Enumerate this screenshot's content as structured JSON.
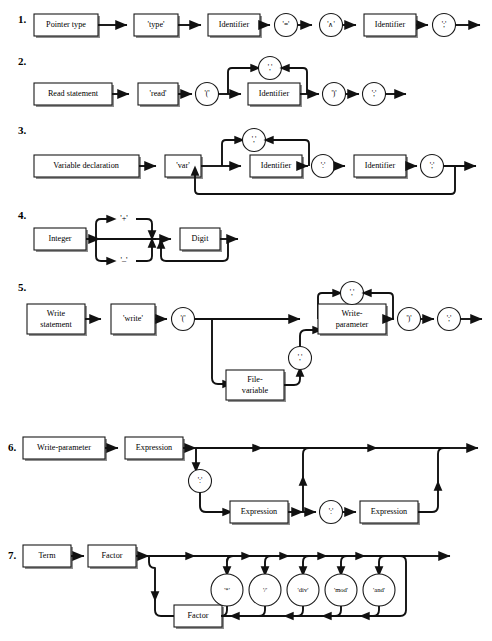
{
  "document": {
    "title": "Syntax Railroad Diagrams",
    "type": "railroad-diagram-sheet",
    "background": "#ffffff",
    "ink": "#111111",
    "shadow_color": "#8f8f8f",
    "width": 492,
    "height": 641
  },
  "diagrams": [
    {
      "number": "1.",
      "name": "pointer-type",
      "nodes": [
        {
          "kind": "box",
          "label": "Pointer type"
        },
        {
          "kind": "circle",
          "label": "'type'"
        },
        {
          "kind": "box",
          "label": "Identifier"
        },
        {
          "kind": "circle",
          "label": "'='"
        },
        {
          "kind": "circle",
          "label": "'∧'"
        },
        {
          "kind": "box",
          "label": "Identifier"
        },
        {
          "kind": "circle",
          "label": "';'"
        }
      ],
      "terminals": [
        "'type'",
        "'='",
        "'∧'",
        "';'"
      ],
      "nonterminals": [
        "Pointer type",
        "Identifier"
      ]
    },
    {
      "number": "2.",
      "name": "read-statement",
      "nodes": [
        {
          "kind": "box",
          "label": "Read statement"
        },
        {
          "kind": "box",
          "label": "'read'"
        },
        {
          "kind": "circle",
          "label": "'('"
        },
        {
          "kind": "box",
          "label": "Identifier"
        },
        {
          "kind": "circle",
          "label": "','"
        },
        {
          "kind": "circle",
          "label": "')'"
        },
        {
          "kind": "circle",
          "label": "';'"
        }
      ],
      "loops": [
        {
          "from": "Identifier",
          "through": "','",
          "to": "Identifier"
        }
      ],
      "terminals": [
        "'read'",
        "'('",
        "','",
        "')'",
        "';'"
      ],
      "nonterminals": [
        "Read statement",
        "Identifier"
      ]
    },
    {
      "number": "3.",
      "name": "variable-declaration",
      "nodes": [
        {
          "kind": "box",
          "label": "Variable declaration"
        },
        {
          "kind": "box",
          "label": "'var'"
        },
        {
          "kind": "box",
          "label": "Identifier"
        },
        {
          "kind": "circle",
          "label": "','"
        },
        {
          "kind": "circle",
          "label": "':'"
        },
        {
          "kind": "box",
          "label": "Identifier"
        },
        {
          "kind": "circle",
          "label": "';'"
        }
      ],
      "loops": [
        {
          "from": "Identifier",
          "through": "','",
          "to": "Identifier"
        },
        {
          "from": "';'",
          "through": "",
          "to": "Identifier"
        }
      ],
      "terminals": [
        "'var'",
        "','",
        "':'",
        "';'"
      ],
      "nonterminals": [
        "Variable declaration",
        "Identifier"
      ]
    },
    {
      "number": "4.",
      "name": "integer",
      "nodes": [
        {
          "kind": "box",
          "label": "Integer"
        },
        {
          "kind": "plain",
          "label": "'+'"
        },
        {
          "kind": "plain",
          "label": "'–'"
        },
        {
          "kind": "box",
          "label": "Digit"
        }
      ],
      "loops": [
        {
          "from": "Digit",
          "through": "",
          "to": "Digit"
        }
      ],
      "terminals": [
        "'+'",
        "'–'"
      ],
      "nonterminals": [
        "Integer",
        "Digit"
      ]
    },
    {
      "number": "5.",
      "name": "write-statement",
      "nodes": [
        {
          "kind": "box",
          "label": "Write statement"
        },
        {
          "kind": "box",
          "label": "'write'"
        },
        {
          "kind": "circle",
          "label": "'('"
        },
        {
          "kind": "box",
          "label": "File-variable"
        },
        {
          "kind": "circle",
          "label": "','"
        },
        {
          "kind": "box",
          "label": "Write-parameter"
        },
        {
          "kind": "circle",
          "label": "','"
        },
        {
          "kind": "circle",
          "label": "')'"
        },
        {
          "kind": "circle",
          "label": "';'"
        }
      ],
      "loops": [
        {
          "from": "Write-parameter",
          "through": "','",
          "to": "Write-parameter"
        }
      ],
      "terminals": [
        "'write'",
        "'('",
        "','",
        "')'",
        "';'"
      ],
      "nonterminals": [
        "Write statement",
        "File-variable",
        "Write-parameter"
      ]
    },
    {
      "number": "6.",
      "name": "write-parameter",
      "nodes": [
        {
          "kind": "box",
          "label": "Write-parameter"
        },
        {
          "kind": "box",
          "label": "Expression"
        },
        {
          "kind": "circle",
          "label": "':'"
        },
        {
          "kind": "box",
          "label": "Expression"
        },
        {
          "kind": "circle",
          "label": "':'"
        },
        {
          "kind": "box",
          "label": "Expression"
        }
      ],
      "terminals": [
        "':'"
      ],
      "nonterminals": [
        "Write-parameter",
        "Expression"
      ]
    },
    {
      "number": "7.",
      "name": "term",
      "nodes": [
        {
          "kind": "box",
          "label": "Term"
        },
        {
          "kind": "box",
          "label": "Factor"
        },
        {
          "kind": "circle",
          "label": "'*'"
        },
        {
          "kind": "circle",
          "label": "'/'"
        },
        {
          "kind": "circle",
          "label": "'div'"
        },
        {
          "kind": "circle",
          "label": "'mod'"
        },
        {
          "kind": "circle",
          "label": "'and'"
        },
        {
          "kind": "box",
          "label": "Factor"
        }
      ],
      "loops": [
        {
          "from": "Factor",
          "through": "'*' | '/' | 'div' | 'mod' | 'and'",
          "to": "Factor"
        }
      ],
      "terminals": [
        "'*'",
        "'/'",
        "'div'",
        "'mod'",
        "'and'"
      ],
      "nonterminals": [
        "Term",
        "Factor"
      ]
    }
  ],
  "labels": {
    "d1_n": "1.",
    "d2_n": "2.",
    "d3_n": "3.",
    "d4_n": "4.",
    "d5_n": "5.",
    "d6_n": "6.",
    "d7_n": "7.",
    "d1_b1": "Pointer type",
    "d1_c1": "'type'",
    "d1_b2": "Identifier",
    "d1_c2": "'='",
    "d1_c3": "'∧'",
    "d1_b3": "Identifier",
    "d1_c4": "';'",
    "d2_b1": "Read statement",
    "d2_b2": "'read'",
    "d2_c1": "'('",
    "d2_b3": "Identifier",
    "d2_c2": "','",
    "d2_c3": "')'",
    "d2_c4": "';'",
    "d3_b1": "Variable declaration",
    "d3_b2": "'var'",
    "d3_b3": "Identifier",
    "d3_c1": "','",
    "d3_c2": "':'",
    "d3_b4": "Identifier",
    "d3_c3": "';'",
    "d4_b1": "Integer",
    "d4_t1": "'+'",
    "d4_t2": "'–'",
    "d4_b2": "Digit",
    "d5_b1a": "Write",
    "d5_b1b": "statement",
    "d5_b2": "'write'",
    "d5_c1": "'('",
    "d5_b3a": "File-",
    "d5_b3b": "variable",
    "d5_c2": "','",
    "d5_b4a": "Write-",
    "d5_b4b": "parameter",
    "d5_c3": "','",
    "d5_c4": "')'",
    "d5_c5": "';'",
    "d6_b1": "Write-parameter",
    "d6_b2": "Expression",
    "d6_c1": "':'",
    "d6_b3": "Expression",
    "d6_c2": "':'",
    "d6_b4": "Expression",
    "d7_b1": "Term",
    "d7_b2": "Factor",
    "d7_c1": "'*'",
    "d7_c2": "'/'",
    "d7_c3": "'div'",
    "d7_c4": "'mod'",
    "d7_c5": "'and'",
    "d7_b3": "Factor"
  }
}
